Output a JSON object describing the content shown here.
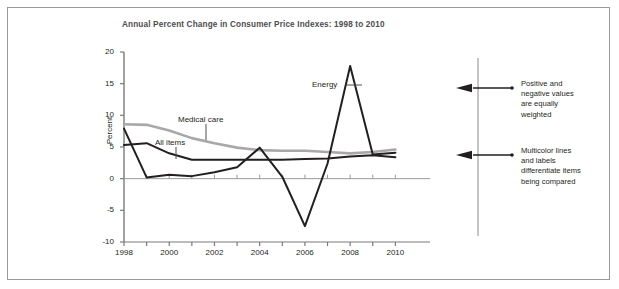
{
  "chart_data": {
    "type": "line",
    "title": "Annual Percent Change in Consumer Price Indexes: 1998 to 2010",
    "xlabel": "",
    "ylabel": "Percent",
    "x": [
      1998,
      1999,
      2000,
      2001,
      2002,
      2003,
      2004,
      2005,
      2006,
      2007,
      2008,
      2009,
      2010
    ],
    "xlim": [
      1998,
      2011
    ],
    "ylim": [
      -10,
      20
    ],
    "ytick_labels": [
      "20",
      "15",
      "10",
      "5",
      "0",
      "-5",
      "-10"
    ],
    "ytick_values": [
      20,
      15,
      10,
      5,
      0,
      -5,
      -10
    ],
    "xtick_labels": [
      "1998",
      "2000",
      "2002",
      "2004",
      "2006",
      "2008",
      "2010"
    ],
    "xtick_values": [
      1998,
      2000,
      2002,
      2004,
      2006,
      2008,
      2010
    ],
    "grid": false,
    "legend_position": "inline-labels",
    "series": [
      {
        "name": "Medical care",
        "color": "#a8a8a8",
        "values": [
          8.6,
          8.5,
          7.6,
          6.4,
          5.6,
          4.9,
          4.5,
          4.4,
          4.4,
          4.2,
          4.0,
          4.2,
          4.6
        ]
      },
      {
        "name": "All items",
        "color": "#231f20",
        "values": [
          5.3,
          5.6,
          4.0,
          3.0,
          3.0,
          3.0,
          3.0,
          3.0,
          3.1,
          3.2,
          3.5,
          3.7,
          3.4
        ]
      },
      {
        "name": "Energy",
        "color": "#231f20",
        "values": [
          7.9,
          0.2,
          0.6,
          0.4,
          1.0,
          1.8,
          4.9,
          0.3,
          -7.5,
          2.4,
          17.8,
          3.8,
          4.1
        ]
      }
    ],
    "annotations": [
      {
        "label": "Medical care",
        "x": 2001.1,
        "y": 8.6
      },
      {
        "label": "All items",
        "x": 2000.3,
        "y": 6.1
      },
      {
        "label": "Energy",
        "x": 2006.2,
        "y": 14.3
      }
    ]
  },
  "callouts": [
    {
      "id": "callout-positive-negative",
      "lines": [
        "Positive and",
        "negative values",
        "are equally",
        "weighted"
      ]
    },
    {
      "id": "callout-multicolor",
      "lines": [
        "Multicolor lines",
        "and labels",
        "differentiate items",
        "being compared"
      ]
    }
  ]
}
